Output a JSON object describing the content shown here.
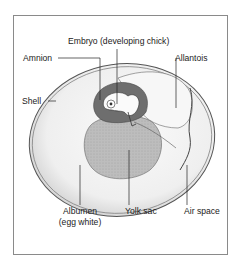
{
  "diagram": {
    "type": "labeled-illustration",
    "labels": {
      "embryo": "Embryo (developing chick)",
      "amnion": "Amnion",
      "allantois": "Allantois",
      "shell": "Shell",
      "albumen": "Albumen",
      "albumen_note": "(egg white)",
      "yolk_sac": "Yolk sac",
      "air_space": "Air space"
    },
    "colors": {
      "frame": "#8a8a8a",
      "shell_outline": "#555555",
      "albumen_fill": "#f1f1f1",
      "amnion_fill": "#6e6e6e",
      "yolk_fill": "#b9b9b9",
      "leader_line": "#222222"
    }
  }
}
